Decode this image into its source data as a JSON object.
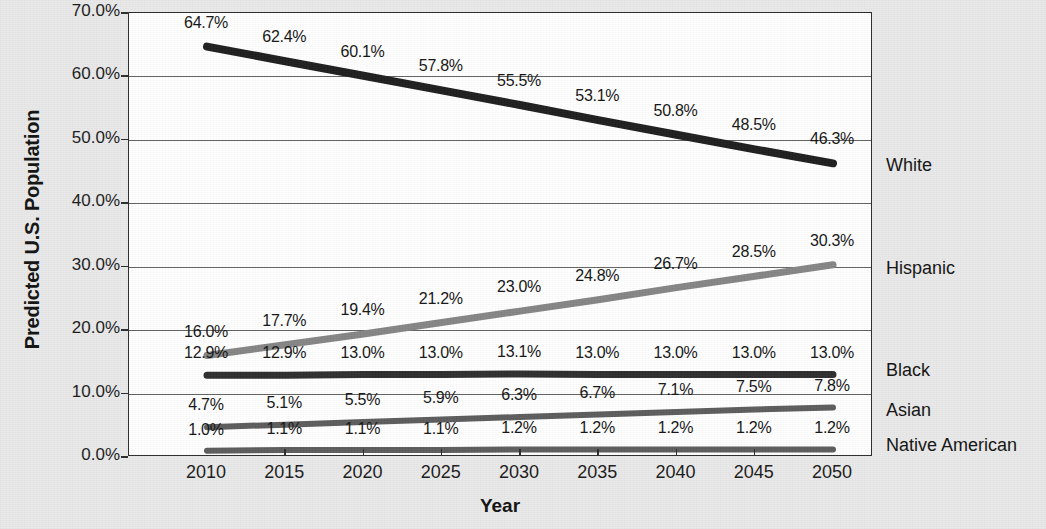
{
  "chart_data": {
    "type": "line",
    "title": "",
    "xlabel": "Year",
    "ylabel": "Predicted U.S. Population",
    "x": [
      2010,
      2015,
      2020,
      2025,
      2030,
      2035,
      2040,
      2045,
      2050
    ],
    "categories": [
      "2010",
      "2015",
      "2020",
      "2025",
      "2030",
      "2035",
      "2040",
      "2045",
      "2050"
    ],
    "xlim": [
      2010,
      2050
    ],
    "ylim": [
      0,
      70
    ],
    "y_tick_labels": [
      "0.0%",
      "10.0%",
      "20.0%",
      "30.0%",
      "40.0%",
      "50.0%",
      "60.0%",
      "70.0%"
    ],
    "y_tick_values": [
      0,
      10,
      20,
      30,
      40,
      50,
      60,
      70
    ],
    "grid": "horizontal",
    "legend_position": "right-inline-end-of-line",
    "series": [
      {
        "name": "White",
        "color": "#1e1e1e",
        "values": [
          64.7,
          62.4,
          60.1,
          57.8,
          55.5,
          53.1,
          50.8,
          48.5,
          46.3
        ],
        "labels": [
          "64.7%",
          "62.4%",
          "60.1%",
          "57.8%",
          "55.5%",
          "53.1%",
          "50.8%",
          "48.5%",
          "46.3%"
        ]
      },
      {
        "name": "Hispanic",
        "color": "#858585",
        "values": [
          16.0,
          17.7,
          19.4,
          21.2,
          23.0,
          24.8,
          26.7,
          28.5,
          30.3
        ],
        "labels": [
          "16.0%",
          "17.7%",
          "19.4%",
          "21.2%",
          "23.0%",
          "24.8%",
          "26.7%",
          "28.5%",
          "30.3%"
        ]
      },
      {
        "name": "Black",
        "color": "#2e2e2e",
        "values": [
          12.9,
          12.9,
          13.0,
          13.0,
          13.1,
          13.0,
          13.0,
          13.0,
          13.0
        ],
        "labels": [
          "12.9%",
          "12.9%",
          "13.0%",
          "13.0%",
          "13.1%",
          "13.0%",
          "13.0%",
          "13.0%",
          "13.0%"
        ]
      },
      {
        "name": "Asian",
        "color": "#5c5c5c",
        "values": [
          4.7,
          5.1,
          5.5,
          5.9,
          6.3,
          6.7,
          7.1,
          7.5,
          7.8
        ],
        "labels": [
          "4.7%",
          "5.1%",
          "5.5%",
          "5.9%",
          "6.3%",
          "6.7%",
          "7.1%",
          "7.5%",
          "7.8%"
        ]
      },
      {
        "name": "Native American",
        "color": "#5c5c5c",
        "values": [
          1.0,
          1.1,
          1.1,
          1.1,
          1.2,
          1.2,
          1.2,
          1.2,
          1.2
        ],
        "labels": [
          "1.0%",
          "1.1%",
          "1.1%",
          "1.1%",
          "1.2%",
          "1.2%",
          "1.2%",
          "1.2%",
          "1.2%"
        ]
      }
    ],
    "series_end_labels": [
      {
        "name": "White",
        "y_px": 155
      },
      {
        "name": "Hispanic",
        "y_px": 258
      },
      {
        "name": "Black",
        "y_px": 360
      },
      {
        "name": "Asian",
        "y_px": 400
      },
      {
        "name": "Native American",
        "y_px": 435
      }
    ]
  },
  "colors": {
    "page_background": "#e9e9e9",
    "plot_background": "#ffffff",
    "axis": "#2b2b2b",
    "gridline": "#636363",
    "text": "#141414"
  }
}
